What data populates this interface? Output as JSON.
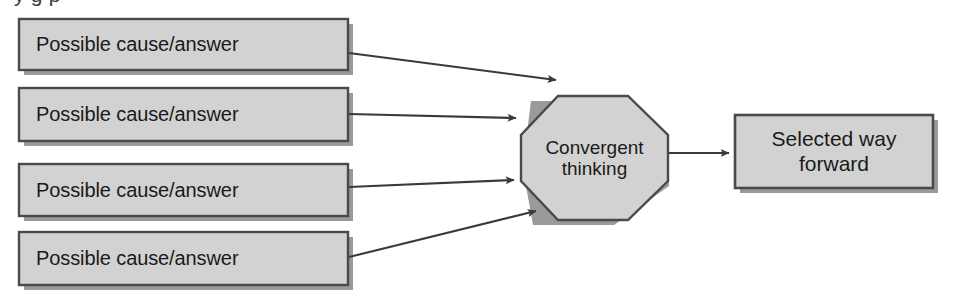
{
  "diagram": {
    "type": "flowchart",
    "title_partial_cut_off_at_top": "y   g              p",
    "colors": {
      "node_fill": "#d2d2d2",
      "node_border": "#4a4a4a",
      "node_shadow": "#9a9a9a",
      "connector": "#3a3a3a",
      "text": "#1a1a1a",
      "background": "#ffffff"
    },
    "inputs": {
      "label": "Possible cause/answer",
      "items": [
        {
          "id": "cause-1",
          "label": "Possible cause/answer"
        },
        {
          "id": "cause-2",
          "label": "Possible cause/answer"
        },
        {
          "id": "cause-3",
          "label": "Possible cause/answer"
        },
        {
          "id": "cause-4",
          "label": "Possible cause/answer"
        }
      ]
    },
    "process": {
      "id": "convergent-thinking",
      "shape": "octagon",
      "label": "Convergent\nthinking",
      "line1": "Convergent",
      "line2": "thinking"
    },
    "outcome": {
      "id": "selected-way-forward",
      "shape": "rectangle",
      "label": "Selected way\nforward",
      "line1": "Selected way",
      "line2": "forward"
    },
    "connectors": [
      {
        "from": "cause-1",
        "to": "convergent-thinking",
        "arrowhead": true
      },
      {
        "from": "cause-2",
        "to": "convergent-thinking",
        "arrowhead": true
      },
      {
        "from": "cause-3",
        "to": "convergent-thinking",
        "arrowhead": true
      },
      {
        "from": "cause-4",
        "to": "convergent-thinking",
        "arrowhead": true
      },
      {
        "from": "convergent-thinking",
        "to": "selected-way-forward",
        "arrowhead": true
      }
    ]
  }
}
